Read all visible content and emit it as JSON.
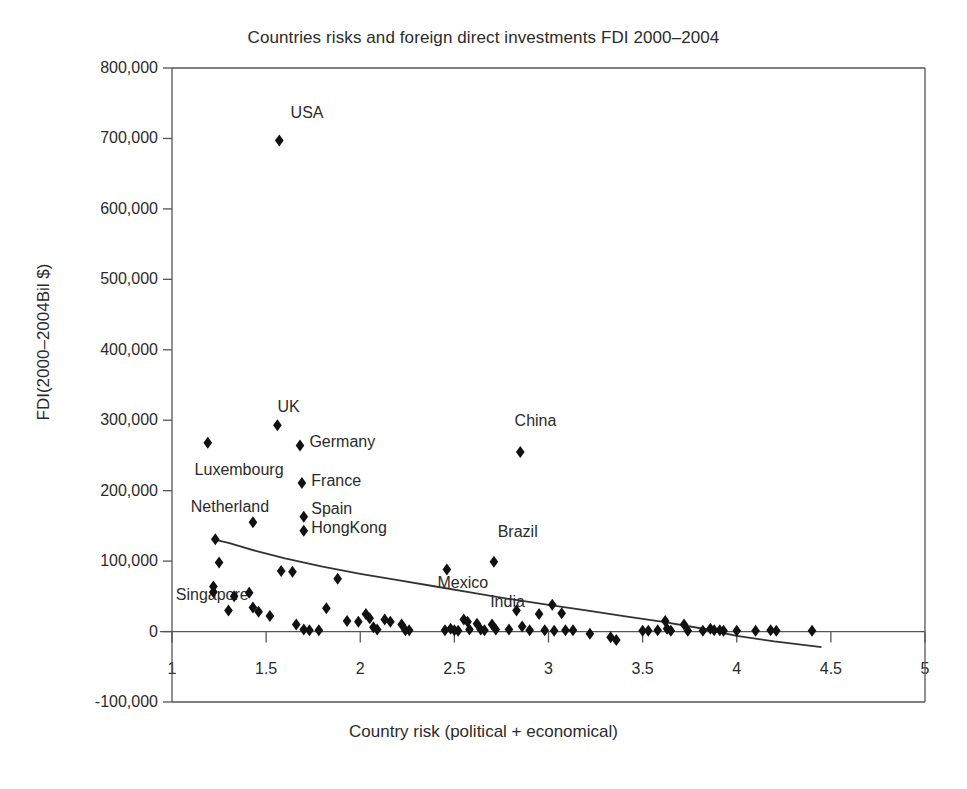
{
  "chart_data": {
    "type": "scatter",
    "title": "Countries risks and foreign direct investments FDI 2000–2004",
    "xlabel": "Country risk (political + economical)",
    "ylabel": "FDI(2000–2004Bil $)",
    "xlim": [
      1,
      5
    ],
    "ylim": [
      -100000,
      800000
    ],
    "grid": false,
    "legend": null,
    "xticks": [
      "1",
      "1.5",
      "2",
      "2.5",
      "3",
      "3.5",
      "4",
      "4.5",
      "5"
    ],
    "xtick_values": [
      1,
      1.5,
      2,
      2.5,
      3,
      3.5,
      4,
      4.5,
      5
    ],
    "yticks": [
      "800,000",
      "700,000",
      "600,000",
      "500,000",
      "400,000",
      "300,000",
      "200,000",
      "100,000",
      "0",
      "-100,000"
    ],
    "ytick_values": [
      800000,
      700000,
      600000,
      500000,
      400000,
      300000,
      200000,
      100000,
      0,
      -100000
    ],
    "marker": "diamond",
    "marker_color": "#111111",
    "trendline_color": "#333333",
    "annotations": [
      {
        "text": "USA",
        "x": 1.63,
        "y": 735000
      },
      {
        "text": "UK",
        "x": 1.56,
        "y": 318000
      },
      {
        "text": "Germany",
        "x": 1.73,
        "y": 268000
      },
      {
        "text": "Luxembourg",
        "x": 1.12,
        "y": 228000
      },
      {
        "text": "France",
        "x": 1.74,
        "y": 213000
      },
      {
        "text": "Netherland",
        "x": 1.1,
        "y": 176000
      },
      {
        "text": "Spain",
        "x": 1.74,
        "y": 172000
      },
      {
        "text": "HongKong",
        "x": 1.74,
        "y": 146000
      },
      {
        "text": "China",
        "x": 2.82,
        "y": 297000
      },
      {
        "text": "Brazil",
        "x": 2.73,
        "y": 140000
      },
      {
        "text": "Mexico",
        "x": 2.41,
        "y": 68000
      },
      {
        "text": "Singapore",
        "x": 1.02,
        "y": 50000
      },
      {
        "text": "India",
        "x": 2.69,
        "y": 40000
      }
    ],
    "points": [
      {
        "x": 1.57,
        "y": 697000,
        "label": "USA"
      },
      {
        "x": 1.56,
        "y": 293000,
        "label": "UK"
      },
      {
        "x": 1.68,
        "y": 264000,
        "label": "Germany"
      },
      {
        "x": 1.19,
        "y": 268000,
        "label": "Luxembourg"
      },
      {
        "x": 1.69,
        "y": 211000,
        "label": "France"
      },
      {
        "x": 1.43,
        "y": 155000,
        "label": "Netherland"
      },
      {
        "x": 1.7,
        "y": 163000,
        "label": "Spain"
      },
      {
        "x": 1.7,
        "y": 143000,
        "label": "HongKong"
      },
      {
        "x": 2.85,
        "y": 255000,
        "label": "China"
      },
      {
        "x": 2.71,
        "y": 99000,
        "label": "Brazil"
      },
      {
        "x": 2.46,
        "y": 88000,
        "label": "Mexico"
      },
      {
        "x": 1.23,
        "y": 131000
      },
      {
        "x": 1.25,
        "y": 98000
      },
      {
        "x": 1.22,
        "y": 64000
      },
      {
        "x": 1.22,
        "y": 56000
      },
      {
        "x": 1.33,
        "y": 50000
      },
      {
        "x": 1.3,
        "y": 30000
      },
      {
        "x": 1.41,
        "y": 55000
      },
      {
        "x": 1.43,
        "y": 34000
      },
      {
        "x": 1.46,
        "y": 28000
      },
      {
        "x": 1.52,
        "y": 22000
      },
      {
        "x": 1.58,
        "y": 86000
      },
      {
        "x": 1.64,
        "y": 85000
      },
      {
        "x": 1.66,
        "y": 10000
      },
      {
        "x": 1.7,
        "y": 3000
      },
      {
        "x": 1.73,
        "y": 2000
      },
      {
        "x": 1.78,
        "y": 2000
      },
      {
        "x": 1.82,
        "y": 33000
      },
      {
        "x": 1.88,
        "y": 75000
      },
      {
        "x": 1.93,
        "y": 15000
      },
      {
        "x": 1.99,
        "y": 14000
      },
      {
        "x": 2.03,
        "y": 25000
      },
      {
        "x": 2.05,
        "y": 19000
      },
      {
        "x": 2.07,
        "y": 6000
      },
      {
        "x": 2.09,
        "y": 3000
      },
      {
        "x": 2.13,
        "y": 17000
      },
      {
        "x": 2.16,
        "y": 14000
      },
      {
        "x": 2.22,
        "y": 10000
      },
      {
        "x": 2.24,
        "y": 2000
      },
      {
        "x": 2.26,
        "y": 2000
      },
      {
        "x": 2.45,
        "y": 2000
      },
      {
        "x": 2.48,
        "y": 4000
      },
      {
        "x": 2.5,
        "y": 2000
      },
      {
        "x": 2.52,
        "y": 1000
      },
      {
        "x": 2.55,
        "y": 17000
      },
      {
        "x": 2.57,
        "y": 14000
      },
      {
        "x": 2.58,
        "y": 3000
      },
      {
        "x": 2.62,
        "y": 11000
      },
      {
        "x": 2.64,
        "y": 3000
      },
      {
        "x": 2.66,
        "y": 2000
      },
      {
        "x": 2.7,
        "y": 10000
      },
      {
        "x": 2.72,
        "y": 3000
      },
      {
        "x": 2.79,
        "y": 3000
      },
      {
        "x": 2.83,
        "y": 30000
      },
      {
        "x": 2.86,
        "y": 7000
      },
      {
        "x": 2.9,
        "y": 2000
      },
      {
        "x": 2.95,
        "y": 25000
      },
      {
        "x": 2.98,
        "y": 2000
      },
      {
        "x": 3.02,
        "y": 38000
      },
      {
        "x": 3.03,
        "y": 1000
      },
      {
        "x": 3.07,
        "y": 26000
      },
      {
        "x": 3.09,
        "y": 2000
      },
      {
        "x": 3.13,
        "y": 2000
      },
      {
        "x": 3.22,
        "y": -3000
      },
      {
        "x": 3.33,
        "y": -8000
      },
      {
        "x": 3.36,
        "y": -12000
      },
      {
        "x": 3.5,
        "y": 1000
      },
      {
        "x": 3.53,
        "y": 1000
      },
      {
        "x": 3.58,
        "y": 2000
      },
      {
        "x": 3.62,
        "y": 15000
      },
      {
        "x": 3.63,
        "y": 4000
      },
      {
        "x": 3.65,
        "y": 1000
      },
      {
        "x": 3.72,
        "y": 10000
      },
      {
        "x": 3.74,
        "y": 1000
      },
      {
        "x": 3.82,
        "y": 1000
      },
      {
        "x": 3.86,
        "y": 4000
      },
      {
        "x": 3.88,
        "y": 2000
      },
      {
        "x": 3.91,
        "y": 2000
      },
      {
        "x": 3.93,
        "y": 1000
      },
      {
        "x": 4.0,
        "y": 1000
      },
      {
        "x": 4.1,
        "y": 1000
      },
      {
        "x": 4.18,
        "y": 2000
      },
      {
        "x": 4.21,
        "y": 1000
      },
      {
        "x": 4.4,
        "y": 1000
      }
    ],
    "trendline": [
      {
        "x": 1.22,
        "y": 131000
      },
      {
        "x": 1.3,
        "y": 126000
      },
      {
        "x": 1.45,
        "y": 114000
      },
      {
        "x": 1.6,
        "y": 104000
      },
      {
        "x": 1.8,
        "y": 92000
      },
      {
        "x": 2.0,
        "y": 82000
      },
      {
        "x": 2.2,
        "y": 73000
      },
      {
        "x": 2.4,
        "y": 64000
      },
      {
        "x": 2.6,
        "y": 55000
      },
      {
        "x": 2.8,
        "y": 46000
      },
      {
        "x": 3.0,
        "y": 38000
      },
      {
        "x": 3.2,
        "y": 30000
      },
      {
        "x": 3.4,
        "y": 22000
      },
      {
        "x": 3.6,
        "y": 14000
      },
      {
        "x": 3.8,
        "y": 5000
      },
      {
        "x": 4.0,
        "y": -6000
      },
      {
        "x": 4.2,
        "y": -14000
      },
      {
        "x": 4.45,
        "y": -22000
      }
    ]
  }
}
